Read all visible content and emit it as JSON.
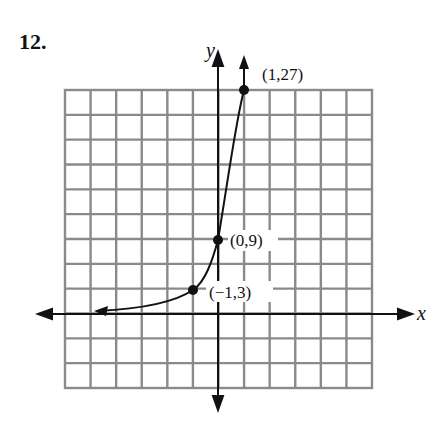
{
  "problem_number": "12.",
  "chart_data": {
    "type": "line",
    "title": "",
    "xlabel": "x",
    "ylabel": "y",
    "function": "y = 9·3^x",
    "points": [
      {
        "x": -1,
        "y": 3,
        "label": "(-1,3)"
      },
      {
        "x": 0,
        "y": 9,
        "label": "(0,9)"
      },
      {
        "x": 1,
        "y": 27,
        "label": "(1,27)"
      }
    ],
    "grid": true,
    "grid_columns": 12,
    "grid_rows": 12,
    "y_scale_per_cell": 3,
    "x_scale_per_cell": 0.5,
    "asymptote": "y = 0 (curve approaches x-axis to the left)"
  },
  "labels": {
    "x_axis": "x",
    "y_axis": "y",
    "p1": "(−1,3)",
    "p2": "(0,9)",
    "p3": "(1,27)"
  }
}
